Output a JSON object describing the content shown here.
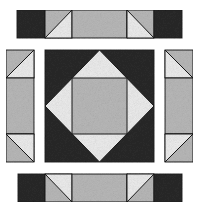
{
  "diagram": {
    "type": "quilt-block-exploded",
    "colors": {
      "dark": "#2a2a2a",
      "medium": "#b9b9b9",
      "light": "#ededed",
      "outline": "#1a1a1a",
      "background": "#ffffff"
    },
    "parts": [
      {
        "name": "top-sashing-strip",
        "pieces": [
          "dark-square",
          "half-square-triangle",
          "medium-rectangle",
          "half-square-triangle",
          "dark-square"
        ]
      },
      {
        "name": "left-sashing-strip",
        "pieces": [
          "half-square-triangle",
          "medium-rectangle",
          "half-square-triangle"
        ]
      },
      {
        "name": "center-square-in-square-block",
        "pieces": [
          "dark-background",
          "light-diamond",
          "medium-center-square"
        ]
      },
      {
        "name": "right-sashing-strip",
        "pieces": [
          "half-square-triangle",
          "medium-rectangle",
          "half-square-triangle"
        ]
      },
      {
        "name": "bottom-sashing-strip",
        "pieces": [
          "dark-square",
          "half-square-triangle",
          "medium-rectangle",
          "half-square-triangle",
          "dark-square"
        ]
      }
    ]
  }
}
